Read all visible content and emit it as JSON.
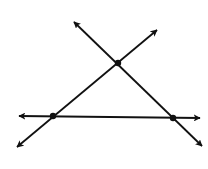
{
  "diagram": {
    "type": "geometry-lines-triangle",
    "colors": {
      "background": "#ffffff",
      "stroke": "#111111",
      "point": "#111111"
    },
    "stroke_width": 1.8,
    "points": [
      {
        "id": "top",
        "x": 118,
        "y": 63
      },
      {
        "id": "bottom-left",
        "x": 53,
        "y": 116
      },
      {
        "id": "bottom-right",
        "x": 173,
        "y": 118
      }
    ],
    "lines": [
      {
        "id": "line-descending",
        "from": {
          "x": 74,
          "y": 22
        },
        "to": {
          "x": 202,
          "y": 146
        },
        "arrows": "both"
      },
      {
        "id": "line-ascending",
        "from": {
          "x": 17,
          "y": 147
        },
        "to": {
          "x": 157,
          "y": 30
        },
        "arrows": "both"
      },
      {
        "id": "line-horizontal",
        "from": {
          "x": 19,
          "y": 116
        },
        "to": {
          "x": 200,
          "y": 118
        },
        "arrows": "both"
      }
    ],
    "labels": []
  }
}
